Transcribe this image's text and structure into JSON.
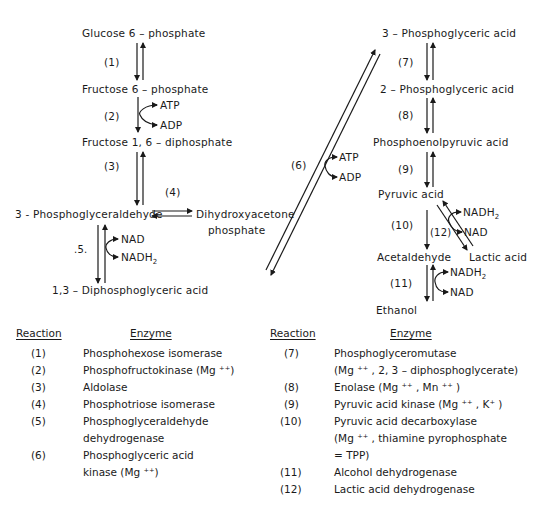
{
  "diagram": {
    "compounds": {
      "glucose6p": "Glucose 6 – phosphate",
      "fructose6p": "Fructose 6 – phosphate",
      "fructose16dp": "Fructose 1, 6 – diphosphate",
      "pgald": "3 - Phosphoglyceraldehyde",
      "dhap_line1": "Dihydroxyacetone",
      "dhap_line2": "phosphate",
      "dpga": "1,3 – Diphosphoglyceric acid",
      "pga3": "3 – Phosphoglyceric acid",
      "pga2": "2 – Phosphoglyceric acid",
      "pep": "Phosphoenolpyruvic acid",
      "pyruvic": "Pyruvic acid",
      "acetaldehyde": "Acetaldehyde",
      "lactic": "Lactic acid",
      "ethanol": "Ethanol"
    },
    "step_labels": {
      "r1": "(1)",
      "r2": "(2)",
      "r3": "(3)",
      "r4": "(4)",
      "r5": ".5.",
      "r6": "(6)",
      "r7": "(7)",
      "r8": "(8)",
      "r9": "(9)",
      "r10": "(10)",
      "r11": "(11)",
      "r12": "(12)"
    },
    "cofactors": {
      "r2_in": "ATP",
      "r2_out": "ADP",
      "r5_in": "NAD",
      "r5_out": "NADH",
      "r6_in": "ATP",
      "r6_out": "ADP",
      "r12_in": "NADH",
      "r12_out": "NAD",
      "r11_in": "NADH",
      "r11_out": "NAD",
      "sub2": "2"
    }
  },
  "table": {
    "left": {
      "header_reaction": "Reaction",
      "header_enzyme": "Enzyme",
      "rows": [
        {
          "reaction": "(1)",
          "enzyme": "Phosphohexose isomerase"
        },
        {
          "reaction": "(2)",
          "enzyme": "Phosphofructokinase (Mg ⁺⁺)"
        },
        {
          "reaction": "(3)",
          "enzyme": "Aldolase"
        },
        {
          "reaction": "(4)",
          "enzyme": "Phosphotriose isomerase"
        },
        {
          "reaction": "(5)",
          "enzyme": "Phosphoglyceraldehyde",
          "enzyme_line2": "dehydrogenase"
        },
        {
          "reaction": "(6)",
          "enzyme": "Phosphoglyceric acid",
          "enzyme_line2": "kinase (Mg ⁺⁺)"
        }
      ]
    },
    "right": {
      "header_reaction": "Reaction",
      "header_enzyme": "Enzyme",
      "rows": [
        {
          "reaction": "(7)",
          "enzyme": "Phosphoglyceromutase",
          "enzyme_line2": "(Mg ⁺⁺ , 2, 3 – diphosphoglycerate)"
        },
        {
          "reaction": "(8)",
          "enzyme": "Enolase (Mg ⁺⁺ , Mn ⁺⁺ )"
        },
        {
          "reaction": "(9)",
          "enzyme": "Pyruvic acid kinase (Mg ⁺⁺ , K⁺ )"
        },
        {
          "reaction": "(10)",
          "enzyme": "Pyruvic acid decarboxylase",
          "enzyme_line2": "(Mg ⁺⁺ , thiamine pyrophosphate",
          "enzyme_line3": "= TPP)"
        },
        {
          "reaction": "(11)",
          "enzyme": "Alcohol dehydrogenase"
        },
        {
          "reaction": "(12)",
          "enzyme": "Lactic acid dehydrogenase"
        }
      ]
    }
  }
}
